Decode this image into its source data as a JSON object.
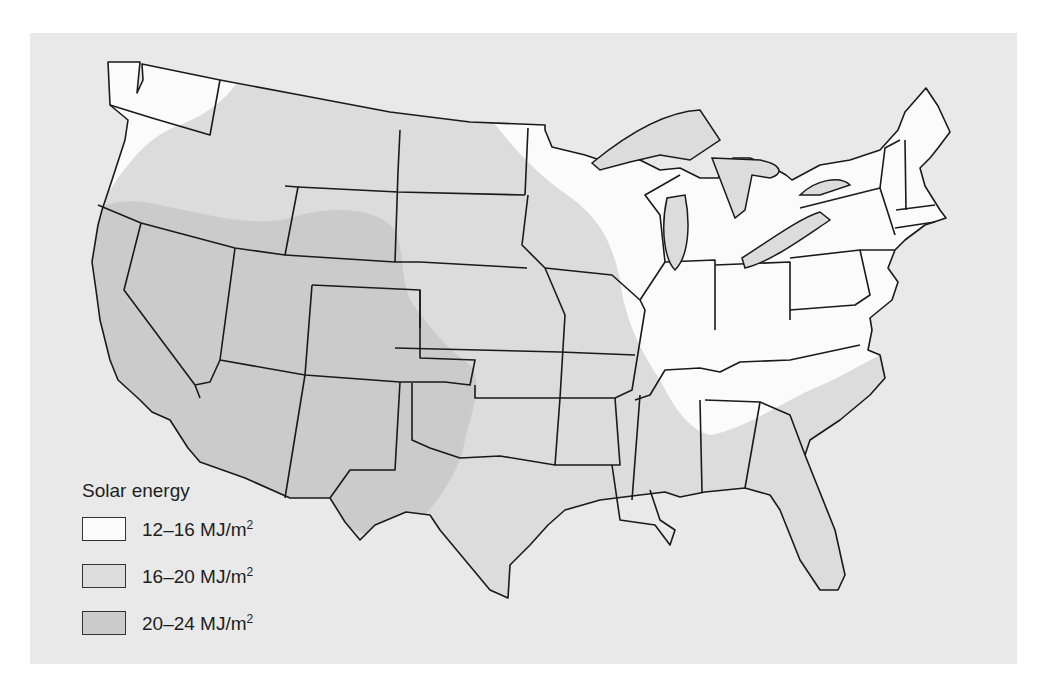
{
  "map": {
    "subject": "Contiguous United States",
    "background_color": "#e9e9e9",
    "state_border_color": "#1a1a1a"
  },
  "legend": {
    "title": "Solar energy",
    "items": [
      {
        "range": "12–16 MJ/m",
        "exp": "2",
        "color": "#fbfbfb"
      },
      {
        "range": "16–20 MJ/m",
        "exp": "2",
        "color": "#dcdcdc"
      },
      {
        "range": "20–24 MJ/m",
        "exp": "2",
        "color": "#cbcbcb"
      }
    ]
  },
  "regions": {
    "low": "12–16 MJ/m2: Pacific Northwest coast, upper Midwest, Great Lakes, Ohio Valley, Northeast",
    "mid": "16–20 MJ/m2: Northern Plains, Central/Southern states, Gulf coast, Southeast, Florida",
    "high": "20–24 MJ/m2: Southwest (California, Nevada, Utah, Arizona, Colorado, New Mexico, West Texas)"
  }
}
